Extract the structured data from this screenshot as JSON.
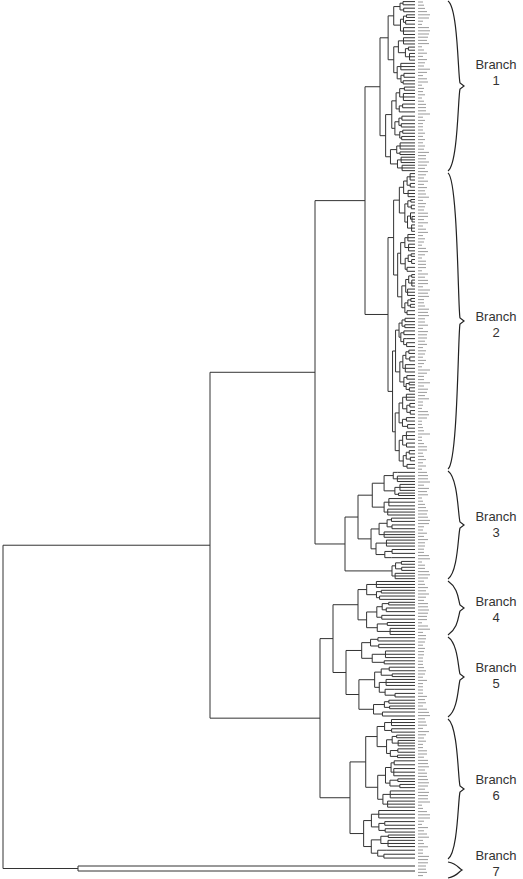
{
  "diagram": {
    "type": "dendrogram",
    "orientation": "horizontal-root-left",
    "line_color": "#333333",
    "background": "#ffffff",
    "leaf_labels_note": "numeric sample IDs rendered vertically at tip of each leaf (too small to read)",
    "branches": [
      {
        "name": "Branch 1",
        "line1": "Branch",
        "line2": "1",
        "y_top": 0,
        "y_bottom": 172,
        "label_y": 73
      },
      {
        "name": "Branch 2",
        "line1": "Branch",
        "line2": "2",
        "y_top": 172,
        "y_bottom": 470,
        "label_y": 325
      },
      {
        "name": "Branch 3",
        "line1": "Branch",
        "line2": "3",
        "y_top": 470,
        "y_bottom": 580,
        "label_y": 525
      },
      {
        "name": "Branch 4",
        "line1": "Branch",
        "line2": "4",
        "y_top": 580,
        "y_bottom": 636,
        "label_y": 610
      },
      {
        "name": "Branch 5",
        "line1": "Branch",
        "line2": "5",
        "y_top": 636,
        "y_bottom": 718,
        "label_y": 676
      },
      {
        "name": "Branch 6",
        "line1": "Branch",
        "line2": "6",
        "y_top": 718,
        "y_bottom": 860,
        "label_y": 788
      },
      {
        "name": "Branch 7",
        "line1": "Branch",
        "line2": "7",
        "y_top": 860,
        "y_bottom": 879,
        "label_y": 858
      }
    ]
  }
}
